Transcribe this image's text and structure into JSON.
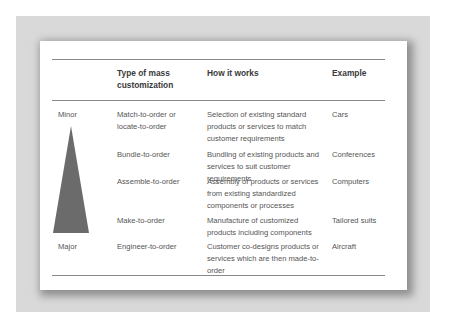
{
  "table": {
    "headers": {
      "scale": "",
      "type": "Type of mass customization",
      "how": "How it works",
      "example": "Example"
    },
    "scale_labels": {
      "top": "Minor",
      "bottom": "Major"
    },
    "triangle_color": "#6b6b6b",
    "rows": [
      {
        "type": "Match-to-order or locate-to-order",
        "how": "Selection of existing standard products or services to match customer requirements",
        "example": "Cars"
      },
      {
        "type": "Bundle-to-order",
        "how": "Bundling of existing products and services to suit customer requirements",
        "example": "Conferences"
      },
      {
        "type": "Assemble-to-order",
        "how": "Assembly of products or services from existing standardized components or processes",
        "example": "Computers"
      },
      {
        "type": "Make-to-order",
        "how": "Manufacture of customized products including components",
        "example": "Tailored suits"
      },
      {
        "type": "Engineer-to-order",
        "how": "Customer co-designs products or services which are then made-to-order",
        "example": "Aircraft"
      }
    ]
  }
}
